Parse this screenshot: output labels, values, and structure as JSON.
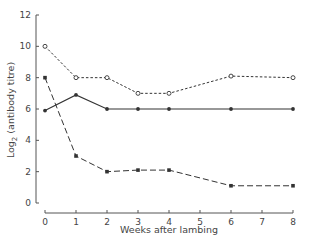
{
  "chart_data": {
    "type": "line",
    "title": "",
    "xlabel": "Weeks after lambing",
    "ylabel": "Log2 (antibody titre)",
    "ylabel_parts": {
      "main": "Log",
      "sub": "2",
      "rest": " (antibody  titre)"
    },
    "xlim": [
      0,
      8
    ],
    "ylim": [
      0,
      12
    ],
    "xticks": [
      0,
      1,
      2,
      3,
      4,
      5,
      6,
      7,
      8
    ],
    "yticks": [
      0,
      2,
      4,
      6,
      8,
      10,
      12
    ],
    "grid": false,
    "legend": null,
    "series": [
      {
        "name": "open-circles-dotted",
        "marker": "open-circle",
        "linestyle": "dotted",
        "x": [
          0,
          1,
          2,
          3,
          4,
          6,
          8
        ],
        "values": [
          10,
          8,
          8,
          7,
          7,
          8.1,
          8
        ]
      },
      {
        "name": "filled-circles-solid",
        "marker": "filled-circle",
        "linestyle": "solid",
        "x": [
          0,
          1,
          2,
          3,
          4,
          6,
          8
        ],
        "values": [
          5.9,
          6.9,
          6,
          6,
          6,
          6,
          6
        ]
      },
      {
        "name": "filled-squares-dashed",
        "marker": "filled-square",
        "linestyle": "dashed",
        "x": [
          0,
          1,
          2,
          3,
          4,
          6,
          8
        ],
        "values": [
          8,
          3,
          2,
          2.1,
          2.1,
          1.1,
          1.1
        ]
      }
    ]
  },
  "colors": {
    "axis": "#555555",
    "line": "#333333",
    "background": "#ffffff"
  }
}
